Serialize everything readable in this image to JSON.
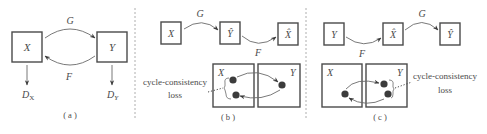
{
  "figure": {
    "panels": [
      {
        "id": "a",
        "caption": "( a )",
        "boxes": [
          {
            "label": "X"
          },
          {
            "label": "Y"
          }
        ],
        "mappings": [
          {
            "label": "G",
            "from": "X",
            "to": "Y"
          },
          {
            "label": "F",
            "from": "Y",
            "to": "X"
          }
        ],
        "discriminators": [
          {
            "label": "D",
            "sub": "X"
          },
          {
            "label": "D",
            "sub": "Y"
          }
        ]
      },
      {
        "id": "b",
        "caption": "( b )",
        "chain": [
          {
            "label": "X"
          },
          {
            "label": "Ŷ"
          },
          {
            "label": "X̂"
          }
        ],
        "chain_mappings": [
          {
            "label": "G"
          },
          {
            "label": "F"
          }
        ],
        "domains": [
          {
            "label": "X"
          },
          {
            "label": "Y"
          }
        ],
        "annotation": {
          "line1": "cycle-consistency",
          "line2": "loss"
        }
      },
      {
        "id": "c",
        "caption": "( c )",
        "chain": [
          {
            "label": "Y"
          },
          {
            "label": "X̂"
          },
          {
            "label": "Ŷ"
          }
        ],
        "chain_mappings": [
          {
            "label": "F"
          },
          {
            "label": "G"
          }
        ],
        "domains": [
          {
            "label": "X"
          },
          {
            "label": "Y"
          }
        ],
        "annotation": {
          "line1": "cycle-consistency",
          "line2": "loss"
        }
      }
    ]
  }
}
